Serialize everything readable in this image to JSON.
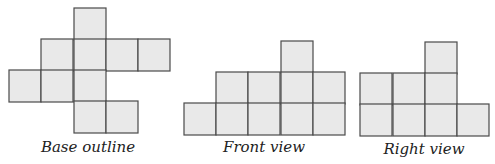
{
  "figures": [
    {
      "name": "base-outline",
      "label": "Base outline",
      "label_x": 88,
      "label_y": 152,
      "cell_size": 32,
      "cells": [
        {
          "x": 74,
          "y": 8
        },
        {
          "x": 41,
          "y": 39
        },
        {
          "x": 74,
          "y": 39
        },
        {
          "x": 106,
          "y": 39
        },
        {
          "x": 138,
          "y": 39
        },
        {
          "x": 9,
          "y": 70
        },
        {
          "x": 41,
          "y": 70
        },
        {
          "x": 74,
          "y": 70
        },
        {
          "x": 74,
          "y": 101
        },
        {
          "x": 106,
          "y": 101
        }
      ]
    },
    {
      "name": "front-view",
      "label": "Front view",
      "label_x": 264,
      "label_y": 152,
      "cell_size": 32,
      "cells": [
        {
          "x": 281,
          "y": 41
        },
        {
          "x": 216,
          "y": 72
        },
        {
          "x": 248,
          "y": 72
        },
        {
          "x": 281,
          "y": 72
        },
        {
          "x": 313,
          "y": 72
        },
        {
          "x": 184,
          "y": 103
        },
        {
          "x": 216,
          "y": 103
        },
        {
          "x": 248,
          "y": 103
        },
        {
          "x": 281,
          "y": 103
        },
        {
          "x": 313,
          "y": 103
        }
      ]
    },
    {
      "name": "right-view",
      "label": "Right view",
      "label_x": 424,
      "label_y": 154,
      "cell_size": 32,
      "cells": [
        {
          "x": 425,
          "y": 42
        },
        {
          "x": 360,
          "y": 73
        },
        {
          "x": 393,
          "y": 73
        },
        {
          "x": 425,
          "y": 73
        },
        {
          "x": 360,
          "y": 104
        },
        {
          "x": 393,
          "y": 104
        },
        {
          "x": 425,
          "y": 104
        },
        {
          "x": 457,
          "y": 104
        }
      ]
    }
  ],
  "colors": {
    "cell_fill": "#e9e9e9",
    "cell_stroke": "#4a4a4a",
    "label": "#222222"
  }
}
